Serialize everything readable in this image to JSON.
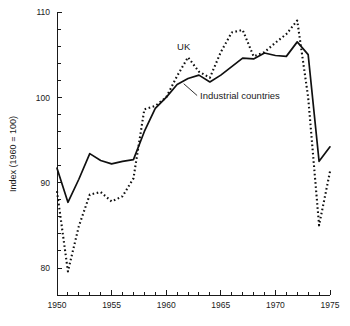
{
  "chart_data": {
    "type": "line",
    "title": "",
    "xlabel": "",
    "ylabel": "Index (1960 = 100)",
    "xlim": [
      1950,
      1975
    ],
    "ylim": [
      78,
      110
    ],
    "grid": false,
    "legend_position": "inline-annotations",
    "x_tick_labels": [
      "1950",
      "1955",
      "1960",
      "1965",
      "1970",
      "1975"
    ],
    "x_tick_values": [
      1950,
      1955,
      1960,
      1965,
      1970,
      1975
    ],
    "x_minor_tick_interval": 1,
    "y_tick_labels": [
      "80",
      "90",
      "100",
      "110"
    ],
    "y_tick_values": [
      80,
      90,
      100,
      110
    ],
    "y_minor_tick_interval": 2,
    "x": [
      1950,
      1951,
      1952,
      1953,
      1954,
      1955,
      1956,
      1957,
      1958,
      1959,
      1960,
      1961,
      1962,
      1963,
      1964,
      1965,
      1966,
      1967,
      1968,
      1969,
      1970,
      1971,
      1972,
      1973,
      1974,
      1975
    ],
    "series": [
      {
        "name": "UK",
        "style": "dotted",
        "label_position": {
          "x": 1961.0,
          "y": 105.6
        },
        "values": [
          89.0,
          79.6,
          84.9,
          88.6,
          88.9,
          87.8,
          88.4,
          90.5,
          98.6,
          99.0,
          100.0,
          102.5,
          104.7,
          103.0,
          102.3,
          105.3,
          107.6,
          107.9,
          104.8,
          105.3,
          106.4,
          107.4,
          109.0,
          100.0,
          85.0,
          91.3
        ]
      },
      {
        "name": "Industrial countries",
        "style": "solid",
        "label_position": {
          "x": 1963.1,
          "y": 99.8
        },
        "values": [
          91.7,
          87.7,
          90.4,
          93.4,
          92.6,
          92.2,
          92.5,
          92.7,
          96.0,
          98.7,
          100.0,
          101.5,
          102.2,
          102.6,
          101.8,
          102.6,
          103.6,
          104.6,
          104.5,
          105.2,
          104.9,
          104.8,
          106.5,
          105.0,
          92.5,
          94.2
        ]
      }
    ]
  },
  "annotations": {
    "uk_label": "UK",
    "industrial_label": "Industrial countries"
  },
  "axes": {
    "y_axis_title": "Index (1960 = 100)"
  }
}
